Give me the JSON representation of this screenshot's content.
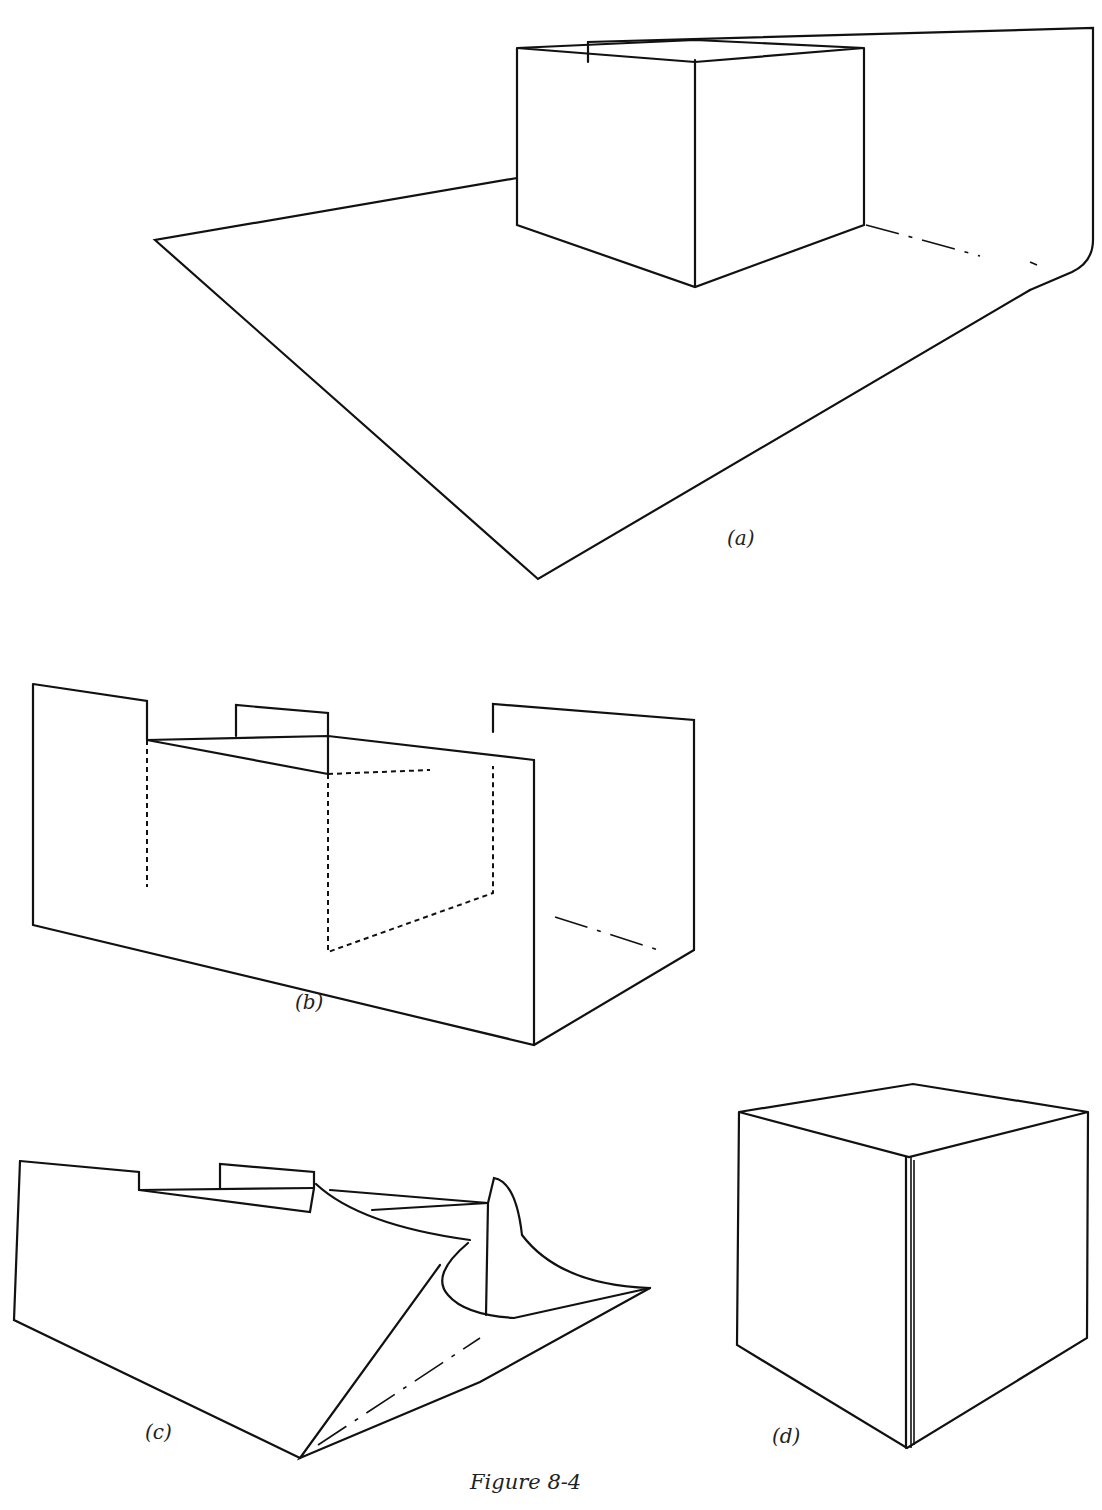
{
  "figure": {
    "caption": "Figure 8-4",
    "panels": [
      {
        "id": "a",
        "label": "(a)",
        "description": "Open box resting on a large sheet whose back edge folds up into a wall"
      },
      {
        "id": "b",
        "label": "(b)",
        "description": "Sheet folded into a U-channel around the box, box edges shown dashed"
      },
      {
        "id": "c",
        "label": "(c)",
        "description": "Channel with one end flap being folded and curled closed"
      },
      {
        "id": "d",
        "label": "(d)",
        "description": "Completed wrapped cube with seam on the front vertical edge"
      }
    ]
  },
  "colors": {
    "ink": "#111111",
    "background": "#ffffff"
  }
}
